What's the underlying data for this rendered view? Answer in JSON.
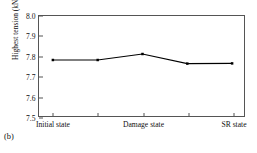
{
  "caption": "(b)",
  "chart_data": {
    "type": "line",
    "title": "",
    "xlabel": "",
    "ylabel": "Highest tension (kN)",
    "ylim": [
      7.5,
      8.0
    ],
    "ytick_labels": [
      "7.5",
      "7.6",
      "7.7",
      "7.8",
      "7.9",
      "8.0"
    ],
    "ytick_values": [
      7.5,
      7.6,
      7.7,
      7.8,
      7.9,
      8.0
    ],
    "grid": false,
    "legend": "none",
    "frame": "box",
    "x": [
      1,
      2,
      3,
      4,
      5
    ],
    "xtick_positions": [
      1,
      2,
      3,
      4,
      5
    ],
    "categories": [
      "Initial state",
      "",
      "Damage state",
      "",
      "SR state"
    ],
    "xtick_labels": [
      "Initial state",
      "Damage state",
      "SR state"
    ],
    "labeled_tick_indices": [
      0,
      2,
      4
    ],
    "values": [
      7.78,
      7.78,
      7.81,
      7.762,
      7.763
    ],
    "marker": "square",
    "marker_color": "#000000",
    "line_color": "#000000",
    "line_width": 1.1
  }
}
